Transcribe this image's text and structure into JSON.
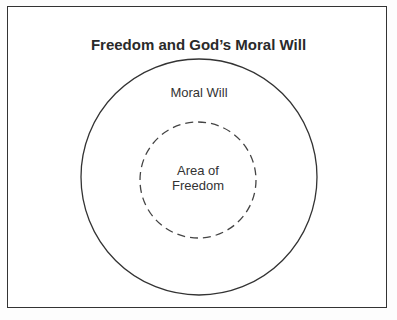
{
  "diagram": {
    "title": "Freedom and God’s Moral Will",
    "outer_circle": {
      "label": "Moral Will",
      "style": "solid"
    },
    "inner_circle": {
      "label_line1": "Area of",
      "label_line2": "Freedom",
      "style": "dashed"
    }
  }
}
